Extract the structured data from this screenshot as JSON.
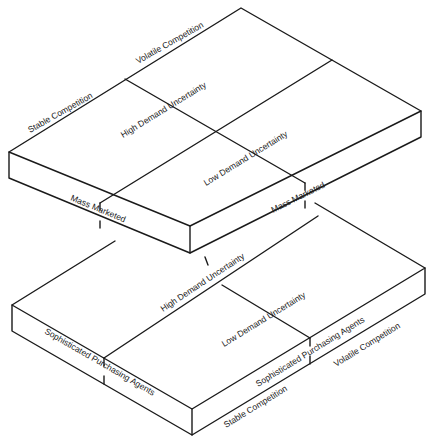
{
  "diagram": {
    "type": "stacked-isometric-slabs",
    "colors": {
      "line": "#1a1a1a",
      "background": "#ffffff"
    },
    "upper_slab": {
      "back_edge_labels": {
        "left": "Stable Competition",
        "right": "Volatile Competition"
      },
      "top_regions": {
        "back": "High Demand Uncertainty",
        "front": "Low Demand Uncertainty"
      },
      "front_edge_labels": {
        "left": "Mass Marketed",
        "right": "Mass Marketed"
      }
    },
    "lower_slab": {
      "top_regions": {
        "back": "High Demand Uncertainty",
        "front": "Low Demand Uncertainty"
      },
      "front_edge_labels": {
        "left": "Sophisticated Purchasing Agents",
        "right": "Sophisticated Purchasing Agents"
      },
      "bottom_edge_labels": {
        "left": "Stable Competition",
        "right": "Volatile Competition"
      }
    }
  }
}
